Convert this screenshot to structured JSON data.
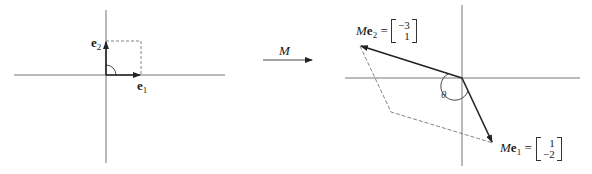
{
  "left_panel": {
    "e1_label": "e",
    "e1_sub": "1",
    "e2_label": "e",
    "e2_sub": "2"
  },
  "transform_arrow": {
    "label": "M"
  },
  "right_panel": {
    "me2_prefix": "M",
    "me2_bold": "e",
    "me2_sub": "2",
    "me2_equals": "=",
    "me2_vector": [
      "−3",
      "1"
    ],
    "me1_prefix": "M",
    "me1_bold": "e",
    "me1_sub": "1",
    "me1_equals": "=",
    "me1_vector": [
      "1",
      "−2"
    ],
    "angle_label": "θ"
  },
  "colors": {
    "axis": "#555555",
    "vector": "#222222",
    "dashed": "#777777"
  }
}
